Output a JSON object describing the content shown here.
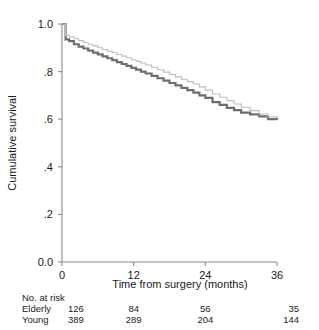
{
  "chart_data": {
    "type": "line",
    "title": "",
    "subtitle": "",
    "xlabel": "Time from surgery (months)",
    "ylabel": "Cumulative survival",
    "xlim": [
      0,
      36
    ],
    "ylim": [
      0,
      1.0
    ],
    "xticks": [
      0,
      12,
      24,
      36
    ],
    "xticklabels": [
      "0",
      "12",
      "24",
      "36"
    ],
    "yticks": [
      0.0,
      0.2,
      0.4,
      0.6,
      0.8,
      1.0
    ],
    "yticklabels": [
      "0.0",
      ".2",
      ".4",
      ".6",
      ".8",
      "1.0"
    ],
    "grid": false,
    "legend_position": "none",
    "step_type": "post",
    "series": [
      {
        "name": "Elderly",
        "color": "#6e6e6e",
        "linewidth": 2.2,
        "x": [
          0,
          0.6,
          1.2,
          2.0,
          2.8,
          3.6,
          4.4,
          5.2,
          6.0,
          6.8,
          7.6,
          8.4,
          9.2,
          10.0,
          10.8,
          11.6,
          12.4,
          13.2,
          14.0,
          15.0,
          16.0,
          17.0,
          18.0,
          19.0,
          20.0,
          21.0,
          22.0,
          23.0,
          24.0,
          25.2,
          26.4,
          27.6,
          28.8,
          30.0,
          31.5,
          33.0,
          34.5,
          36.0
        ],
        "y": [
          1.0,
          0.935,
          0.928,
          0.915,
          0.905,
          0.897,
          0.888,
          0.88,
          0.872,
          0.864,
          0.856,
          0.848,
          0.84,
          0.832,
          0.824,
          0.816,
          0.808,
          0.8,
          0.792,
          0.782,
          0.772,
          0.762,
          0.752,
          0.742,
          0.732,
          0.722,
          0.712,
          0.7,
          0.69,
          0.672,
          0.66,
          0.648,
          0.638,
          0.628,
          0.62,
          0.612,
          0.6,
          0.598
        ]
      },
      {
        "name": "Young",
        "color": "#bdbdbd",
        "linewidth": 1.1,
        "x": [
          0,
          0.6,
          1.2,
          2.0,
          2.8,
          3.6,
          4.4,
          5.2,
          6.0,
          6.8,
          7.6,
          8.4,
          9.2,
          10.0,
          10.8,
          11.6,
          12.4,
          13.2,
          14.0,
          15.0,
          16.0,
          17.0,
          18.0,
          19.0,
          20.0,
          21.0,
          22.0,
          23.0,
          24.0,
          25.2,
          26.4,
          27.6,
          28.8,
          30.0,
          31.5,
          33.0,
          34.5,
          36.0
        ],
        "y": [
          1.0,
          0.952,
          0.946,
          0.938,
          0.93,
          0.922,
          0.915,
          0.908,
          0.9,
          0.893,
          0.886,
          0.879,
          0.872,
          0.865,
          0.858,
          0.85,
          0.843,
          0.836,
          0.828,
          0.818,
          0.808,
          0.798,
          0.788,
          0.778,
          0.768,
          0.758,
          0.748,
          0.736,
          0.722,
          0.706,
          0.692,
          0.678,
          0.664,
          0.65,
          0.636,
          0.622,
          0.61,
          0.605
        ]
      }
    ],
    "risk_table": {
      "title": "No. at risk",
      "times": [
        0,
        12,
        24,
        36
      ],
      "rows": [
        {
          "label": "Elderly",
          "counts": [
            "126",
            "84",
            "56",
            "35"
          ]
        },
        {
          "label": "Young",
          "counts": [
            "389",
            "289",
            "204",
            "144"
          ]
        }
      ]
    }
  }
}
